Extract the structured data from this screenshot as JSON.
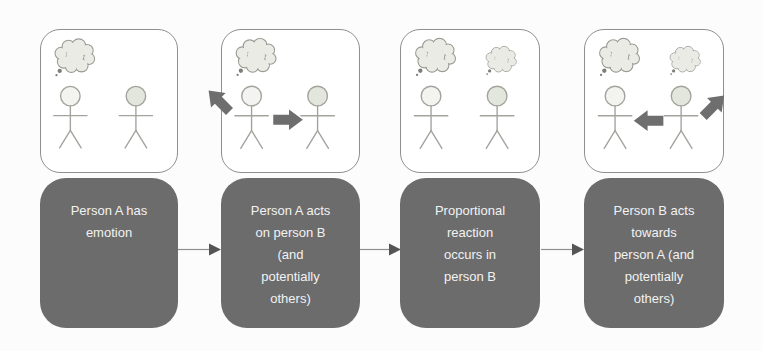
{
  "diagram": {
    "type": "flow",
    "steps": [
      {
        "label": "Person A has\nemotion",
        "scene": {
          "bubble_a": true,
          "bubble_b": false,
          "arrows": []
        }
      },
      {
        "label": "Person A acts\non person B\n(and\npotentially\nothers)",
        "scene": {
          "bubble_a": true,
          "bubble_b": false,
          "arrows": [
            "between-right",
            "out-up-left"
          ]
        }
      },
      {
        "label": "Proportional\nreaction\noccurs in\nperson B",
        "scene": {
          "bubble_a": true,
          "bubble_b": true,
          "arrows": []
        }
      },
      {
        "label": "Person B acts\ntowards\nperson A (and\npotentially\nothers)",
        "scene": {
          "bubble_a": true,
          "bubble_b": true,
          "arrows": [
            "between-left",
            "out-up-right"
          ]
        }
      }
    ],
    "icons": {
      "thought_bubble": "cloud-shape",
      "person": "stick-figure",
      "block_arrow": "fat-arrow-polygon",
      "flow_arrow": "line-with-triangle-head"
    },
    "colors": {
      "stage_bg": "#fcfcfc",
      "box_fill": "#6c6c6c",
      "box_text": "#f2f2f2",
      "panel_fill": "#ffffff",
      "panel_border": "#8f8f8f",
      "figure_stroke": "#a3a39e",
      "head_a_fill": "#f3f3ef",
      "head_b_fill": "#e3e6dc",
      "cloud_fill": "#ebebe6",
      "cloud_stroke": "#9b9b94",
      "cloud_tail": "#7e7e78",
      "block_arrow_fill": "#6e6e6e",
      "connector_line": "#8f8f8f",
      "connector_head": "#555555"
    }
  }
}
